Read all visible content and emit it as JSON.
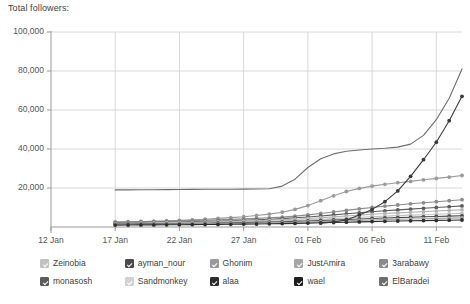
{
  "header": {
    "title": "Total followers:"
  },
  "chart_data": {
    "type": "line",
    "title": "Total followers:",
    "xlabel": "",
    "ylabel": "",
    "ylim": [
      0,
      100000
    ],
    "grid": true,
    "legend_position": "bottom",
    "yticks": [
      "20,000",
      "40,000",
      "60,000",
      "80,000",
      "100,000"
    ],
    "ytick_values": [
      20000,
      40000,
      60000,
      80000,
      100000
    ],
    "xticks": [
      "12 Jan",
      "17 Jan",
      "22 Jan",
      "27 Jan",
      "01 Feb",
      "06 Feb",
      "11 Feb"
    ],
    "xtick_days": [
      0,
      5,
      10,
      15,
      20,
      25,
      30
    ],
    "x": [
      5,
      6,
      7,
      8,
      9,
      10,
      11,
      12,
      13,
      14,
      15,
      16,
      17,
      18,
      19,
      20,
      21,
      22,
      23,
      24,
      25,
      26,
      27,
      28,
      29,
      30,
      31,
      32
    ],
    "series": [
      {
        "name": "wael",
        "color": "#3a3a3a",
        "marker": "circle",
        "values": [
          null,
          null,
          null,
          null,
          null,
          null,
          null,
          null,
          null,
          null,
          null,
          null,
          null,
          null,
          null,
          null,
          2000,
          2600,
          3600,
          6200,
          9000,
          13000,
          18500,
          26000,
          34500,
          43500,
          54500,
          67000
        ]
      },
      {
        "name": "ElBaradei",
        "color": "#6e6e6e",
        "marker": "none",
        "values": [
          19000,
          19050,
          19100,
          19150,
          19200,
          19250,
          19300,
          19350,
          19400,
          19400,
          19450,
          19500,
          19600,
          21000,
          24500,
          30500,
          35000,
          37500,
          38800,
          39500,
          40000,
          40400,
          41000,
          42500,
          47000,
          55000,
          66000,
          81000
        ]
      },
      {
        "name": "Ghonim",
        "color": "#9a9a9a",
        "marker": "circle",
        "values": [
          2300,
          2500,
          2700,
          2900,
          3100,
          3400,
          3700,
          4000,
          4400,
          4800,
          5300,
          5900,
          6600,
          7600,
          9000,
          11000,
          13500,
          16000,
          18200,
          19800,
          21000,
          21900,
          22700,
          23400,
          24200,
          24900,
          25600,
          26400
        ]
      },
      {
        "name": "3arabawy",
        "color": "#8b8b8b",
        "marker": "circle",
        "values": [
          2600,
          2700,
          2800,
          2900,
          3050,
          3200,
          3350,
          3500,
          3700,
          3900,
          4150,
          4400,
          4700,
          5100,
          5600,
          6200,
          6900,
          7700,
          8500,
          9300,
          10000,
          10700,
          11300,
          11900,
          12400,
          13000,
          13500,
          14000
        ]
      },
      {
        "name": "monasosh",
        "color": "#5c5c5c",
        "marker": "circle",
        "values": [
          2100,
          2200,
          2300,
          2400,
          2500,
          2620,
          2750,
          2900,
          3050,
          3250,
          3450,
          3700,
          3950,
          4300,
          4700,
          5150,
          5650,
          6200,
          6750,
          7300,
          7800,
          8300,
          8750,
          9200,
          9600,
          10000,
          10400,
          10800
        ]
      },
      {
        "name": "Sandmonkey",
        "color": "#b3b3b3",
        "marker": "circle",
        "values": [
          1900,
          1980,
          2060,
          2150,
          2240,
          2340,
          2450,
          2570,
          2700,
          2850,
          3020,
          3200,
          3420,
          3700,
          4020,
          4380,
          4780,
          5200,
          5650,
          6100,
          6500,
          6900,
          7250,
          7600,
          7900,
          8200,
          8500,
          8800
        ]
      },
      {
        "name": "Zeinobia",
        "color": "#c2c2c2",
        "marker": "circle",
        "values": [
          1700,
          1760,
          1820,
          1890,
          1960,
          2040,
          2130,
          2230,
          2340,
          2460,
          2600,
          2750,
          2920,
          3130,
          3380,
          3660,
          3970,
          4300,
          4640,
          4980,
          5290,
          5580,
          5850,
          6100,
          6330,
          6550,
          6760,
          6970
        ]
      },
      {
        "name": "ayman_nour",
        "color": "#4a4a4a",
        "marker": "circle",
        "values": [
          1500,
          1550,
          1600,
          1660,
          1720,
          1790,
          1860,
          1940,
          2030,
          2130,
          2240,
          2360,
          2500,
          2660,
          2850,
          3070,
          3310,
          3570,
          3840,
          4110,
          4360,
          4600,
          4820,
          5030,
          5220,
          5400,
          5580,
          5750
        ]
      },
      {
        "name": "JustAmira",
        "color": "#a6a6a6",
        "marker": "circle",
        "values": [
          1300,
          1340,
          1390,
          1440,
          1490,
          1550,
          1610,
          1680,
          1760,
          1840,
          1930,
          2030,
          2140,
          2270,
          2420,
          2590,
          2780,
          2980,
          3190,
          3400,
          3600,
          3790,
          3960,
          4120,
          4270,
          4410,
          4540,
          4670
        ]
      },
      {
        "name": "alaa",
        "color": "#2e2e2e",
        "marker": "circle",
        "values": [
          1000,
          1030,
          1060,
          1100,
          1140,
          1180,
          1230,
          1280,
          1340,
          1400,
          1470,
          1550,
          1640,
          1740,
          1860,
          1990,
          2140,
          2300,
          2460,
          2620,
          2780,
          2920,
          3060,
          3180,
          3300,
          3410,
          3510,
          3610
        ]
      }
    ]
  },
  "legend": {
    "items": [
      {
        "label": "Zeinobia",
        "color": "#c2c2c2",
        "checked": true
      },
      {
        "label": "ayman_nour",
        "color": "#4a4a4a",
        "checked": true
      },
      {
        "label": "Ghonim",
        "color": "#9a9a9a",
        "checked": true
      },
      {
        "label": "JustAmira",
        "color": "#a6a6a6",
        "checked": true
      },
      {
        "label": "3arabawy",
        "color": "#8b8b8b",
        "checked": true
      },
      {
        "label": "monasosh",
        "color": "#5c5c5c",
        "checked": true
      },
      {
        "label": "Sandmonkey",
        "color": "#d2d2d2",
        "checked": true
      },
      {
        "label": "alaa",
        "color": "#2e2e2e",
        "checked": true
      },
      {
        "label": "wael",
        "color": "#1f1f1f",
        "checked": true
      },
      {
        "label": "ElBaradei",
        "color": "#6e6e6e",
        "checked": true
      }
    ]
  },
  "colors": {
    "background": "#ffffff",
    "grid": "#d8d8d8",
    "axis": "#999999",
    "text": "#555555"
  }
}
